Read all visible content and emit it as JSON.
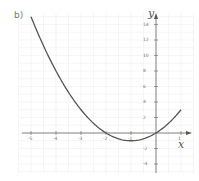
{
  "part_label": "b)",
  "axes": {
    "x_label": "x",
    "y_label": "y"
  },
  "x_ticks": [
    "-5",
    "-4",
    "-3",
    "-2",
    "-1",
    "1"
  ],
  "y_ticks": [
    "14",
    "12",
    "10",
    "8",
    "6",
    "4",
    "2",
    "-2",
    "-4"
  ],
  "colors": {
    "curve": "#555555",
    "axis": "#666666",
    "grid": "#efefef"
  },
  "chart_data": {
    "type": "line",
    "title": "b)",
    "xlabel": "x",
    "ylabel": "y",
    "function": "y = x^2 + 2x",
    "series": [
      {
        "name": "y = x^2 + 2x",
        "x": [
          -5,
          -4.5,
          -4,
          -3.5,
          -3,
          -2.5,
          -2,
          -1.5,
          -1,
          -0.5,
          0,
          0.5,
          1
        ],
        "y": [
          15,
          11.25,
          8,
          5.25,
          3,
          1.25,
          0,
          -0.75,
          -1,
          -0.75,
          0,
          1.25,
          3
        ]
      }
    ],
    "x_ticks": [
      -5,
      -4,
      -3,
      -2,
      -1,
      1
    ],
    "y_ticks": [
      14,
      12,
      10,
      8,
      6,
      4,
      2,
      -2,
      -4
    ],
    "xlim": [
      -5.3,
      1.4
    ],
    "ylim": [
      -5.2,
      15.5
    ],
    "grid": true
  }
}
